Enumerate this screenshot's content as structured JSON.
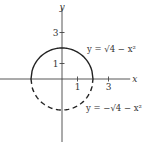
{
  "chart_data": {
    "type": "line",
    "title": "",
    "xlabel": "x",
    "ylabel": "y",
    "xlim": [
      -4,
      4.4
    ],
    "ylim": [
      -4.1,
      4.6
    ],
    "x_ticks": [
      1,
      3
    ],
    "y_ticks": [
      1,
      3
    ],
    "x_tick_labels": [
      "1",
      "3"
    ],
    "y_tick_labels": [
      "1",
      "3"
    ],
    "grid": false,
    "series": [
      {
        "name": "upper semicircle",
        "equation": "y = √(4 − x²)",
        "label": "y = √4 − x²",
        "style": "solid",
        "x_range": [
          -2,
          2
        ],
        "points": [
          [
            -2,
            0
          ],
          [
            -1,
            1.732
          ],
          [
            0,
            2
          ],
          [
            1,
            1.732
          ],
          [
            2,
            0
          ]
        ]
      },
      {
        "name": "lower semicircle",
        "equation": "y = −√(4 − x²)",
        "label": "y = −√4 − x²",
        "style": "dashed",
        "x_range": [
          -2,
          2
        ],
        "points": [
          [
            -2,
            0
          ],
          [
            -1,
            -1.732
          ],
          [
            0,
            -2
          ],
          [
            1,
            -1.732
          ],
          [
            2,
            0
          ]
        ]
      }
    ],
    "colors": {
      "curve": "#222222",
      "axis": "#444444"
    }
  }
}
